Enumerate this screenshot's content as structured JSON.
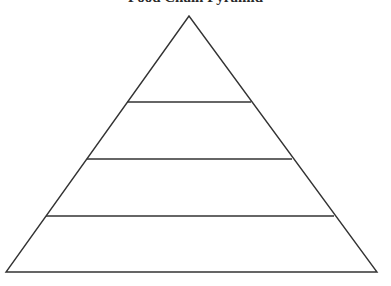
{
  "title": "Food Chain Pyramid",
  "diagram": {
    "type": "pyramid",
    "levels": 4,
    "stroke_color": "#333333",
    "fill_color": "#ffffff",
    "apex": [
      189,
      16
    ],
    "base": [
      [
        6,
        272
      ],
      [
        377,
        272
      ]
    ],
    "dividers_y": [
      102,
      159,
      216
    ],
    "level_labels": [
      "",
      "",
      "",
      ""
    ]
  }
}
